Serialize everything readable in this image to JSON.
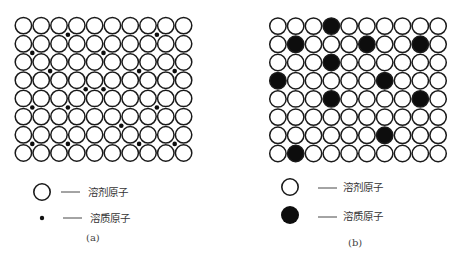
{
  "figure": {
    "panel_a": {
      "label": "(a)",
      "grid": {
        "rows": 8,
        "cols": 10
      },
      "interstitial_solute_positions": [
        [
          0.5,
          2.5
        ],
        [
          0.5,
          7.5
        ],
        [
          1.5,
          0.5
        ],
        [
          1.5,
          4.5
        ],
        [
          2.5,
          1.5
        ],
        [
          2.5,
          6.5
        ],
        [
          2.5,
          8.5
        ],
        [
          3.5,
          3.5
        ],
        [
          3.5,
          4.5
        ],
        [
          4.5,
          0.5
        ],
        [
          4.5,
          2.5
        ],
        [
          4.5,
          7.5
        ],
        [
          5.5,
          5.5
        ],
        [
          6.5,
          0.5
        ],
        [
          6.5,
          2.5
        ],
        [
          6.5,
          6.5
        ],
        [
          6.5,
          8.5
        ]
      ],
      "legend": [
        {
          "symbol": "open-circle",
          "text": "溶剂原子"
        },
        {
          "symbol": "small-dot",
          "text": "溶质原子"
        }
      ]
    },
    "panel_b": {
      "label": "(b)",
      "grid": {
        "rows": 8,
        "cols": 10
      },
      "substitutional_solute_cells": [
        [
          0,
          3
        ],
        [
          1,
          1
        ],
        [
          1,
          5
        ],
        [
          1,
          8
        ],
        [
          2,
          3
        ],
        [
          3,
          0
        ],
        [
          3,
          6
        ],
        [
          4,
          3
        ],
        [
          4,
          8
        ],
        [
          6,
          6
        ],
        [
          7,
          1
        ]
      ],
      "legend": [
        {
          "symbol": "open-circle",
          "text": "溶剂原子"
        },
        {
          "symbol": "filled-circle",
          "text": "溶质原子"
        }
      ]
    },
    "legend_dash": "——",
    "colors": {
      "stroke": "#1a1a1a",
      "fill_solute": "#0d0d0d",
      "fill_solvent": "#ffffff"
    }
  }
}
